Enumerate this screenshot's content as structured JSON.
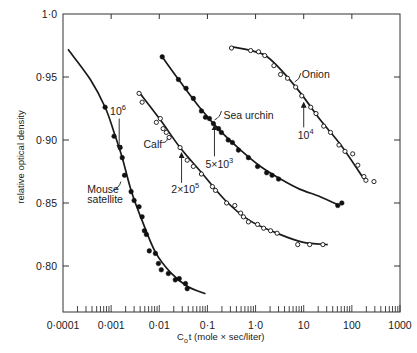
{
  "chart_data": {
    "type": "scatter",
    "title": "",
    "xlabel": "C₀t (mole × sec/liter)",
    "xlabel_main": "C",
    "xlabel_sub": "o",
    "xlabel_rest": "t (mole × sec/liter)",
    "ylabel": "relative optical density",
    "xscale": "log",
    "xlim": [
      0.0001,
      1000
    ],
    "ylim": [
      0.762,
      1.0
    ],
    "grid": false,
    "legend": "none (curves labelled directly)",
    "x_ticks": [
      {
        "value": 0.0001,
        "label": "0·0001"
      },
      {
        "value": 0.001,
        "label": "0·001"
      },
      {
        "value": 0.01,
        "label": "0·01"
      },
      {
        "value": 0.1,
        "label": "0·1"
      },
      {
        "value": 1,
        "label": "1·0"
      },
      {
        "value": 10,
        "label": "10"
      },
      {
        "value": 100,
        "label": "100"
      },
      {
        "value": 1000,
        "label": "1000"
      }
    ],
    "y_ticks": [
      {
        "value": 1.0,
        "label": "1·0"
      },
      {
        "value": 0.95,
        "label": "0·95"
      },
      {
        "value": 0.9,
        "label": "0·90"
      },
      {
        "value": 0.85,
        "label": "0·85"
      },
      {
        "value": 0.8,
        "label": "0·80"
      }
    ],
    "series": [
      {
        "name": "Mouse satellite",
        "marker": "filled-circle",
        "points": [
          [
            0.00075,
            0.926
          ],
          [
            0.00115,
            0.903
          ],
          [
            0.00154,
            0.894
          ],
          [
            0.0017,
            0.886
          ],
          [
            0.0019,
            0.872
          ],
          [
            0.0026,
            0.859
          ],
          [
            0.003,
            0.852
          ],
          [
            0.0038,
            0.847
          ],
          [
            0.0044,
            0.839
          ],
          [
            0.0049,
            0.828
          ],
          [
            0.0054,
            0.825
          ],
          [
            0.0062,
            0.812
          ],
          [
            0.0083,
            0.81
          ],
          [
            0.0096,
            0.802
          ],
          [
            0.011,
            0.797
          ],
          [
            0.0154,
            0.794
          ],
          [
            0.0215,
            0.789
          ],
          [
            0.026,
            0.79
          ],
          [
            0.035,
            0.786
          ],
          [
            0.038,
            0.782
          ]
        ],
        "fit": [
          [
            0.000127,
            0.972
          ],
          [
            0.00037,
            0.948
          ],
          [
            0.00075,
            0.926
          ],
          [
            0.00115,
            0.906
          ],
          [
            0.0017,
            0.886
          ],
          [
            0.0026,
            0.86
          ],
          [
            0.0044,
            0.836
          ],
          [
            0.0083,
            0.811
          ],
          [
            0.017,
            0.795
          ],
          [
            0.038,
            0.784
          ],
          [
            0.091,
            0.778
          ]
        ]
      },
      {
        "name": "Calf",
        "marker": "open-circle",
        "points": [
          [
            0.0038,
            0.937
          ],
          [
            0.0044,
            0.93
          ],
          [
            0.0087,
            0.914
          ],
          [
            0.0105,
            0.917
          ],
          [
            0.012,
            0.909
          ],
          [
            0.014,
            0.906
          ],
          [
            0.016,
            0.902
          ],
          [
            0.027,
            0.894
          ],
          [
            0.038,
            0.884
          ],
          [
            0.051,
            0.879
          ],
          [
            0.075,
            0.873
          ],
          [
            0.127,
            0.863
          ],
          [
            0.147,
            0.86
          ],
          [
            0.25,
            0.85
          ],
          [
            0.37,
            0.848
          ],
          [
            0.49,
            0.842
          ],
          [
            0.56,
            0.839
          ],
          [
            0.71,
            0.835
          ],
          [
            1.1,
            0.833
          ],
          [
            1.47,
            0.83
          ],
          [
            2.05,
            0.828
          ],
          [
            2.8,
            0.826
          ],
          [
            7.5,
            0.817
          ],
          [
            13.3,
            0.817
          ],
          [
            25,
            0.817
          ]
        ],
        "fit": [
          [
            0.0038,
            0.938
          ],
          [
            0.0105,
            0.916
          ],
          [
            0.027,
            0.894
          ],
          [
            0.072,
            0.875
          ],
          [
            0.236,
            0.852
          ],
          [
            0.76,
            0.836
          ],
          [
            2.8,
            0.826
          ],
          [
            9.4,
            0.819
          ],
          [
            31.6,
            0.817
          ]
        ]
      },
      {
        "name": "Sea urchin",
        "marker": "filled-circle",
        "points": [
          [
            0.0115,
            0.966
          ],
          [
            0.025,
            0.948
          ],
          [
            0.036,
            0.941
          ],
          [
            0.051,
            0.933
          ],
          [
            0.075,
            0.923
          ],
          [
            0.091,
            0.918
          ],
          [
            0.11,
            0.917
          ],
          [
            0.133,
            0.913
          ],
          [
            0.17,
            0.909
          ],
          [
            0.195,
            0.906
          ],
          [
            0.27,
            0.9
          ],
          [
            0.33,
            0.898
          ],
          [
            0.44,
            0.892
          ],
          [
            0.71,
            0.886
          ],
          [
            1.1,
            0.879
          ],
          [
            1.7,
            0.874
          ],
          [
            2.2,
            0.872
          ],
          [
            3.0,
            0.869
          ],
          [
            51,
            0.848
          ],
          [
            62,
            0.85
          ]
        ],
        "fit": [
          [
            0.0115,
            0.966
          ],
          [
            0.0275,
            0.946
          ],
          [
            0.0718,
            0.925
          ],
          [
            0.187,
            0.907
          ],
          [
            0.49,
            0.892
          ],
          [
            1.27,
            0.879
          ],
          [
            3.3,
            0.869
          ],
          [
            8.2,
            0.861
          ],
          [
            22,
            0.855
          ],
          [
            55,
            0.848
          ]
        ]
      },
      {
        "name": "Onion",
        "marker": "open-circle",
        "points": [
          [
            0.316,
            0.973
          ],
          [
            0.79,
            0.971
          ],
          [
            1.15,
            0.97
          ],
          [
            1.55,
            0.967
          ],
          [
            2.4,
            0.959
          ],
          [
            3.3,
            0.952
          ],
          [
            4.6,
            0.949
          ],
          [
            6.8,
            0.942
          ],
          [
            9.1,
            0.935
          ],
          [
            14,
            0.926
          ],
          [
            18,
            0.921
          ],
          [
            26,
            0.911
          ],
          [
            36,
            0.906
          ],
          [
            54,
            0.896
          ],
          [
            72,
            0.891
          ],
          [
            104,
            0.889
          ],
          [
            133,
            0.88
          ],
          [
            178,
            0.871
          ],
          [
            196,
            0.868
          ],
          [
            288,
            0.867
          ]
        ],
        "fit": [
          [
            0.316,
            0.974
          ],
          [
            0.79,
            0.971
          ],
          [
            1.6,
            0.967
          ],
          [
            3.3,
            0.956
          ],
          [
            8.7,
            0.937
          ],
          [
            22,
            0.916
          ],
          [
            59,
            0.896
          ],
          [
            178,
            0.869
          ]
        ]
      }
    ],
    "annotations": [
      {
        "kind": "arrow",
        "base": "10",
        "exp": "6",
        "text_at": [
          0.00095,
          0.92
        ],
        "arrow_x": 0.00147,
        "arrow_from": 0.917,
        "arrow_to": 0.894
      },
      {
        "kind": "arrow",
        "base": "2×10",
        "exp": "5",
        "text_at": [
          0.0178,
          0.858
        ],
        "arrow_x": 0.029,
        "arrow_from": 0.866,
        "arrow_to": 0.888
      },
      {
        "kind": "arrow",
        "base": "5×10",
        "exp": "3",
        "text_at": [
          0.091,
          0.878
        ],
        "arrow_x": 0.14,
        "arrow_from": 0.887,
        "arrow_to": 0.91
      },
      {
        "kind": "arrow",
        "base": "10",
        "exp": "4",
        "text_at": [
          7.5,
          0.901
        ],
        "arrow_x": 10,
        "arrow_from": 0.91,
        "arrow_to": 0.928
      },
      {
        "kind": "label",
        "lines": [
          "Mouse",
          "satellite"
        ],
        "text_at": [
          0.00032,
          0.858
        ],
        "leader": [
          [
            0.0011,
            0.86
          ],
          [
            0.0016,
            0.867
          ]
        ]
      },
      {
        "kind": "label",
        "lines": [
          "Calf"
        ],
        "text_at": [
          0.0047,
          0.894
        ],
        "leader": [
          [
            0.0116,
            0.898
          ],
          [
            0.0147,
            0.901
          ]
        ]
      },
      {
        "kind": "label",
        "lines": [
          "Sea urchin"
        ],
        "text_at": [
          0.215,
          0.917
        ],
        "leader": [
          [
            0.195,
            0.923
          ],
          [
            0.141,
            0.916
          ]
        ]
      },
      {
        "kind": "label",
        "lines": [
          "Onion"
        ],
        "text_at": [
          9.1,
          0.949
        ],
        "leader": [
          [
            8.7,
            0.953
          ],
          [
            6.5,
            0.946
          ]
        ]
      }
    ]
  }
}
